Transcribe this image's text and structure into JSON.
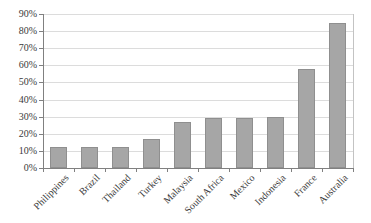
{
  "chart_data": {
    "type": "bar",
    "title": "",
    "xlabel": "",
    "ylabel": "",
    "categories": [
      "Philippines",
      "Brazil",
      "Thailand",
      "Turkey",
      "Malaysia",
      "South Africa",
      "Mexico",
      "Indonesia",
      "France",
      "Australia"
    ],
    "values": [
      12,
      12,
      12,
      17,
      27,
      29,
      29,
      30,
      58,
      85
    ],
    "value_format": "percent",
    "ylim": [
      0,
      90
    ],
    "y_tick_step": 10,
    "y_tick_labels": [
      "0%",
      "10%",
      "20%",
      "30%",
      "40%",
      "50%",
      "60%",
      "70%",
      "80%",
      "90%"
    ],
    "grid": true,
    "legend": false,
    "x_label_rotation_deg": -45,
    "single_series": true
  },
  "colors": {
    "bar_fill": "#a6a6a6",
    "bar_border": "#8f8f8f",
    "gridline": "#dcdcdc",
    "plot_border": "#c3c3c3",
    "axis_line": "#808080",
    "tick": "#808080",
    "text": "#3a3a3a",
    "background": "#ffffff"
  }
}
